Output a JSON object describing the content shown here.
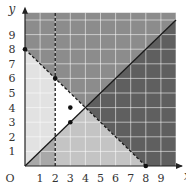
{
  "chart_data": {
    "type": "area",
    "title": "",
    "xlabel": "x",
    "ylabel": "y",
    "origin_label": "O",
    "xlim": [
      0,
      10
    ],
    "ylim": [
      0,
      10.5
    ],
    "grid": true,
    "x_ticks": [
      "1",
      "2",
      "3",
      "4",
      "5",
      "6",
      "7",
      "8",
      "9"
    ],
    "y_ticks": [
      "1",
      "2",
      "3",
      "4",
      "5",
      "6",
      "7",
      "8",
      "9"
    ],
    "lines": [
      {
        "name": "y = x",
        "style": "solid",
        "points": [
          [
            0,
            0
          ],
          [
            10,
            10
          ]
        ]
      },
      {
        "name": "x + y = 8",
        "style": "dashed",
        "points": [
          [
            0,
            8
          ],
          [
            8,
            0
          ]
        ]
      },
      {
        "name": "x = 2",
        "style": "dashed",
        "points": [
          [
            2,
            0
          ],
          [
            2,
            10.5
          ]
        ]
      }
    ],
    "points": [
      {
        "x": 0,
        "y": 8
      },
      {
        "x": 2,
        "y": 6
      },
      {
        "x": 3,
        "y": 4
      },
      {
        "x": 3,
        "y": 3
      },
      {
        "x": 8,
        "y": 0
      }
    ],
    "regions": [
      {
        "name": "above both lines",
        "shade": "#8c8c8c"
      },
      {
        "name": "above x+y=8, below y=x",
        "shade": "#5f5f5f"
      },
      {
        "name": "below x+y=8, above y=x, x<2",
        "shade": "#e2e2e2"
      },
      {
        "name": "feasible region (unshaded)",
        "shade": "#ffffff"
      },
      {
        "name": "below x+y=8, below y=x",
        "shade": "#c4c4c4"
      }
    ]
  }
}
